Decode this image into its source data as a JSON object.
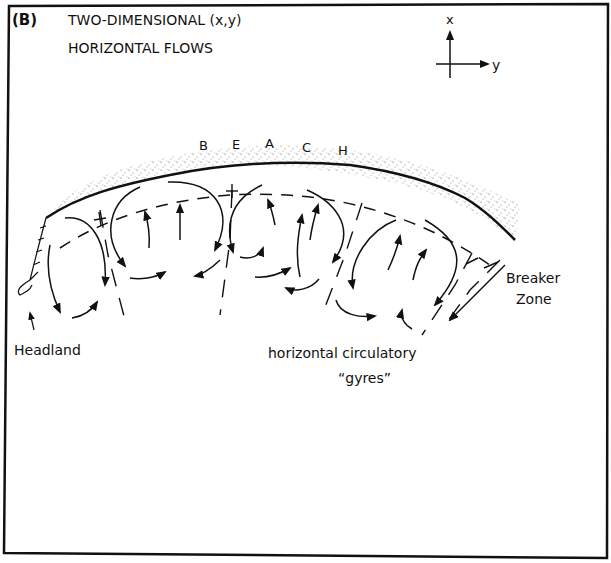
{
  "figure": {
    "panel_label": "(B)",
    "title_line1": "TWO-DIMENSIONAL (x,y)",
    "title_line2": "HORIZONTAL FLOWS"
  },
  "axes": {
    "x_label": "x",
    "y_label": "y"
  },
  "beach": {
    "letters": [
      "B",
      "E",
      "A",
      "C",
      "H"
    ]
  },
  "labels": {
    "headland": "Headland",
    "breaker_zone_line1": "Breaker",
    "breaker_zone_line2": "Zone",
    "gyres_line1": "horizontal circulatory",
    "gyres_line2": "“gyres”"
  },
  "colors": {
    "ink": "#111111",
    "background": "#ffffff",
    "sand": "#555555"
  }
}
